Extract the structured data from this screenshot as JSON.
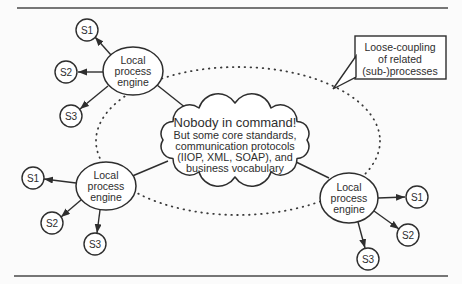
{
  "colors": {
    "ink": "#2e2e2e",
    "rule": "#4a4a4a",
    "paper": "#fbfbfb",
    "shape_fill": "#ffffff"
  },
  "callout": {
    "lines": [
      "Loose-coupling",
      "of related",
      "(sub-)processes"
    ]
  },
  "cloud": {
    "title": "Nobody in command!",
    "body": [
      "But some core standards,",
      "communication protocols",
      "(IIOP, XML, SOAP), and",
      "business vocabulary"
    ]
  },
  "clusters": [
    {
      "position": "top-left",
      "engine": {
        "lines": [
          "Local",
          "process",
          "engine"
        ]
      },
      "satellites": [
        {
          "label": "S1"
        },
        {
          "label": "S2"
        },
        {
          "label": "S3"
        }
      ]
    },
    {
      "position": "bottom-left",
      "engine": {
        "lines": [
          "Local",
          "process",
          "engine"
        ]
      },
      "satellites": [
        {
          "label": "S1"
        },
        {
          "label": "S2"
        },
        {
          "label": "S3"
        }
      ]
    },
    {
      "position": "right",
      "engine": {
        "lines": [
          "Local",
          "process",
          "engine"
        ]
      },
      "satellites": [
        {
          "label": "S1"
        },
        {
          "label": "S2"
        },
        {
          "label": "S3"
        }
      ]
    }
  ]
}
